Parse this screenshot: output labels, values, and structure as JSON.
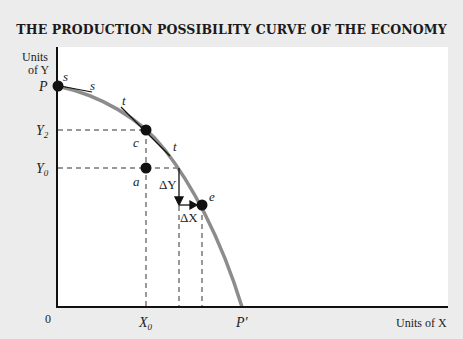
{
  "title": "THE PRODUCTION POSSIBILITY CURVE OF THE ECONOMY",
  "axes": {
    "y_label_line1": "Units",
    "y_label_line2": "of Y",
    "x_label": "Units of X",
    "origin": "0"
  },
  "ticks": {
    "y_top": "P",
    "y2_base": "Y",
    "y2_sub": "2",
    "y0_base": "Y",
    "y0_sub": "0",
    "x0_base": "X",
    "x0_sub": "0",
    "x_end": "P′"
  },
  "points": {
    "p_tangent_1": "s",
    "p_tangent_2": "s",
    "c_tangent_1": "t",
    "c_tangent_2": "t",
    "c": "c",
    "a": "a",
    "e": "e"
  },
  "deltas": {
    "delta_y": "ΔY",
    "delta_x": "ΔX"
  },
  "colors": {
    "curve": "#8c8c8c",
    "axis": "#111111",
    "background": "#ececec",
    "plot": "#ffffff"
  }
}
